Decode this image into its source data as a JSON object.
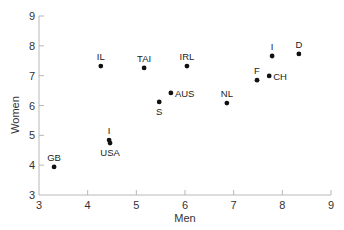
{
  "chart_data": {
    "type": "scatter",
    "title": "",
    "xlabel": "Men",
    "ylabel": "Women",
    "xlim": [
      3,
      9
    ],
    "ylim": [
      3,
      9
    ],
    "xticks": [
      3,
      4,
      5,
      6,
      7,
      8,
      9
    ],
    "yticks": [
      3,
      4,
      5,
      6,
      7,
      8,
      9
    ],
    "grid": false,
    "legend": null,
    "points": [
      {
        "label": "IL",
        "x": 4.27,
        "y": 7.32,
        "label_pos": "above"
      },
      {
        "label": "TAI",
        "x": 5.16,
        "y": 7.26,
        "label_pos": "above"
      },
      {
        "label": "IRL",
        "x": 6.04,
        "y": 7.32,
        "label_pos": "above"
      },
      {
        "label": "AUS",
        "x": 5.71,
        "y": 6.42,
        "label_pos": "right"
      },
      {
        "label": "S",
        "x": 5.47,
        "y": 6.12,
        "label_pos": "below"
      },
      {
        "label": "NL",
        "x": 6.86,
        "y": 6.08,
        "label_pos": "above"
      },
      {
        "label": "F",
        "x": 7.48,
        "y": 6.85,
        "label_pos": "above"
      },
      {
        "label": "CH",
        "x": 7.73,
        "y": 6.99,
        "label_pos": "right"
      },
      {
        "label": "I",
        "x": 7.79,
        "y": 7.66,
        "label_pos": "above"
      },
      {
        "label": "D",
        "x": 8.34,
        "y": 7.73,
        "label_pos": "above"
      },
      {
        "label": "I",
        "x": 4.44,
        "y": 4.84,
        "label_pos": "above"
      },
      {
        "label": "USA",
        "x": 4.46,
        "y": 4.74,
        "label_pos": "below"
      },
      {
        "label": "GB",
        "x": 3.31,
        "y": 3.94,
        "label_pos": "above"
      }
    ]
  },
  "colors": {
    "axis": "#b8b8b8",
    "point": "#111111",
    "text": "#333333"
  }
}
